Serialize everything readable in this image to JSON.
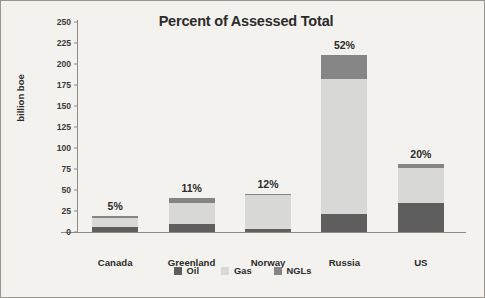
{
  "chart_data": {
    "type": "bar",
    "subtype": "stacked-bar",
    "title": "Percent of Assessed Total",
    "xlabel": "",
    "ylabel": "billion boe",
    "ylim": [
      0,
      250
    ],
    "yticks": [
      0,
      25,
      50,
      75,
      100,
      125,
      150,
      175,
      200,
      225,
      250
    ],
    "grid": false,
    "legend_position": "bottom",
    "categories": [
      "Canada",
      "Greenland",
      "Norway",
      "Russia",
      "US"
    ],
    "series": [
      {
        "name": "Oil",
        "color": "#5e5e5e",
        "values": [
          6,
          10,
          4,
          21,
          34
        ]
      },
      {
        "name": "Gas",
        "color": "#d8d8d6",
        "values": [
          11,
          25,
          40,
          161,
          42
        ]
      },
      {
        "name": "NGLs",
        "color": "#858585",
        "values": [
          2,
          6,
          1,
          29,
          5
        ]
      }
    ],
    "totals": [
      19,
      41,
      45,
      211,
      81
    ],
    "annotations": [
      "5%",
      "11%",
      "12%",
      "52%",
      "20%"
    ]
  },
  "legend": {
    "items": [
      {
        "label": "Oil",
        "color": "#5e5e5e"
      },
      {
        "label": "Gas",
        "color": "#d8d8d6"
      },
      {
        "label": "NGLs",
        "color": "#858585"
      }
    ]
  }
}
